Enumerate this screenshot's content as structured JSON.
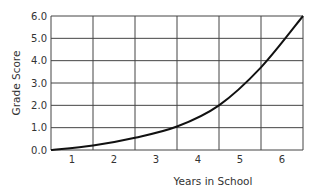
{
  "chart_data": {
    "type": "line",
    "title": "",
    "xlabel": "Years in School",
    "ylabel": "Grade Score",
    "x_tick_labels": [
      "1",
      "2",
      "3",
      "4",
      "5",
      "6"
    ],
    "y_tick_labels": [
      "0.0",
      "1.0",
      "2.0",
      "3.0",
      "4.0",
      "5.0",
      "6.0"
    ],
    "xlim": [
      0.5,
      6.5
    ],
    "ylim": [
      0,
      6
    ],
    "grid": true,
    "legend": null,
    "series": [
      {
        "name": "Grade Score",
        "color": "#111111",
        "x": [
          0.5,
          1.5,
          2.5,
          3.5,
          4.5,
          5.5,
          6.5
        ],
        "values": [
          0.0,
          0.2,
          0.55,
          1.05,
          2.0,
          3.7,
          6.0
        ]
      }
    ]
  },
  "colors": {
    "grid": "#444444",
    "line": "#111111",
    "background": "#ffffff"
  }
}
